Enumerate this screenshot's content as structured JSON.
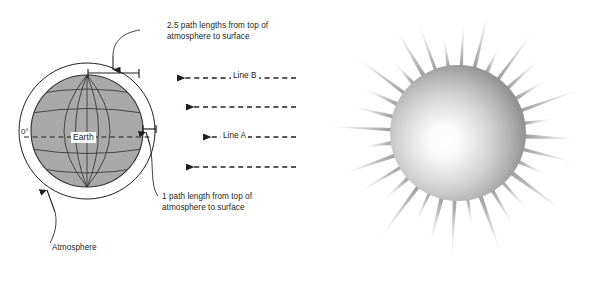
{
  "figure": {
    "panels": [
      "earth-atmosphere-diagram",
      "sun-illustration"
    ]
  },
  "earth_panel": {
    "labels": {
      "path_25": "2.5 path lengths from top of\natmosphere to surface",
      "path_1": "1 path length from top of\natmosphere to surface",
      "atmosphere": "Atmosphere",
      "equator_degrees": "0°",
      "earth": "Earth"
    },
    "rays": [
      {
        "name": "ray-line-b",
        "label": "Line B",
        "y": 78,
        "tip_x": 176,
        "end_x": 296
      },
      {
        "name": "ray-unlabeled-upper",
        "label": "",
        "y": 107,
        "tip_x": 185,
        "end_x": 296
      },
      {
        "name": "ray-line-a",
        "label": "Line A",
        "y": 137,
        "tip_x": 202,
        "end_x": 296
      },
      {
        "name": "ray-unlabeled-lower",
        "label": "",
        "y": 167,
        "tip_x": 185,
        "end_x": 296
      }
    ],
    "geometry": {
      "earth_center_x": 87,
      "earth_center_y": 131,
      "earth_radius": 56,
      "atmosphere_radius": 68,
      "meridian_count": 5,
      "parallel_count": 5
    },
    "colors": {
      "earth_fill": "#a9a9a9",
      "grid_line": "#3a3a3a",
      "outline": "#231f20",
      "background": "#ffffff"
    }
  },
  "sun_panel": {
    "geometry": {
      "center_x": 458,
      "center_y": 133,
      "disc_radius": 68,
      "ray_count": 32,
      "ray_min_length": 30,
      "ray_max_length": 72,
      "highlight_x_pct": 40,
      "highlight_y_pct": 56
    },
    "colors": {
      "core_highlight": "#ffffff",
      "disc_mid": "#d0d0d0",
      "disc_edge": "#8e8e8e",
      "ray_base": "#9a9a9a",
      "ray_tip": "#ffffff"
    }
  }
}
